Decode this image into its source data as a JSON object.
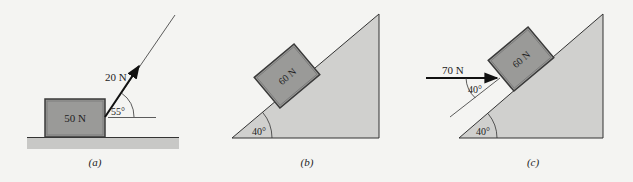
{
  "colors": {
    "background": "#f4f4f2",
    "block_fill": "#9a9a98",
    "block_edge": "#3a3a3a",
    "ground_fill": "#c8c8c6",
    "incline_fill": "#d0d0ce",
    "line": "#333333"
  },
  "panels": [
    {
      "caption": "(a)",
      "block_label": "50 N",
      "force_label": "20 N",
      "angle_label": "55°"
    },
    {
      "caption": "(b)",
      "block_label": "60 N",
      "incline_angle_label": "40°"
    },
    {
      "caption": "(c)",
      "block_label": "60 N",
      "force_label": "70 N",
      "force_angle_label": "40°",
      "incline_angle_label": "40°"
    }
  ]
}
